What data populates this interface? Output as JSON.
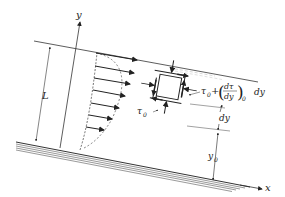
{
  "diagram": {
    "axes": {
      "x_label": "x",
      "y_label": "y"
    },
    "labels": {
      "L": "L",
      "tau0": "τ",
      "tau0_sub": "0",
      "tau_top_prefix": "τ",
      "tau_top_sub": "0",
      "tau_top_plus": "+",
      "tau_top_num": "dτ",
      "tau_top_den": "dy",
      "tau_top_deriv_sub": "0",
      "tau_top_dy": "dy",
      "dy": "dy",
      "y0": "y",
      "y0_sub": "0"
    },
    "velocity_profile": {
      "arrow_count": 7,
      "shape": "parabolic"
    },
    "colors": {
      "ink": "#333333",
      "background": "#ffffff"
    }
  }
}
